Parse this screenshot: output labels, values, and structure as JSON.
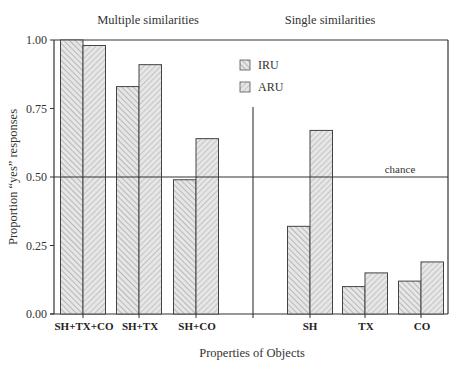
{
  "chart_data": {
    "type": "bar",
    "title": "",
    "group_labels": [
      "Multiple similarities",
      "Single similarities"
    ],
    "categories": [
      "SH+TX+CO",
      "SH+TX",
      "SH+CO",
      "SH",
      "TX",
      "CO"
    ],
    "series": [
      {
        "name": "IRU",
        "values": [
          1.0,
          0.83,
          0.49,
          0.32,
          0.1,
          0.12
        ]
      },
      {
        "name": "ARU",
        "values": [
          0.98,
          0.91,
          0.64,
          0.67,
          0.15,
          0.19
        ]
      }
    ],
    "xlabel": "Properties of Objects",
    "ylabel": "Proportion “yes” responses",
    "ylim": [
      0,
      1.0
    ],
    "yticks": [
      "0.00",
      "0.25",
      "0.50",
      "0.75",
      "1.00"
    ],
    "reference_line": {
      "value": 0.5,
      "label": "chance"
    },
    "grid": false,
    "legend_position": "upper-center"
  },
  "labels": {
    "group_multiple": "Multiple similarities",
    "group_single": "Single similarities",
    "xlabel": "Properties of Objects",
    "ylabel": "Proportion “yes” responses",
    "chance": "chance",
    "legend_iru": "IRU",
    "legend_aru": "ARU",
    "ytick_0": "0.00",
    "ytick_1": "0.25",
    "ytick_2": "0.50",
    "ytick_3": "0.75",
    "ytick_4": "1.00",
    "cat_0": "SH+TX+CO",
    "cat_1": "SH+TX",
    "cat_2": "SH+CO",
    "cat_3": "SH",
    "cat_4": "TX",
    "cat_5": "CO"
  }
}
